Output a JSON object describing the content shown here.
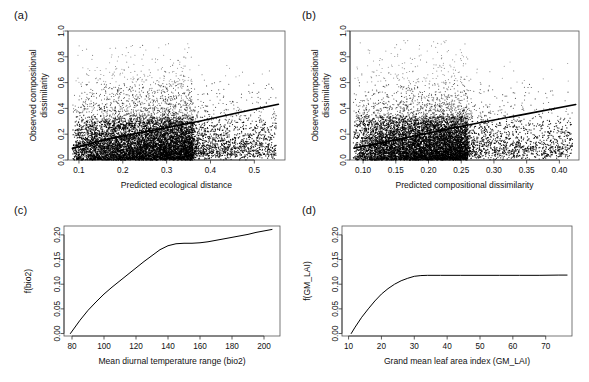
{
  "figure": {
    "background": "#ffffff",
    "ink": "#111111",
    "panel_tags": [
      "(a)",
      "(b)",
      "(c)",
      "(d)"
    ]
  },
  "chart_data": [
    {
      "type": "scatter",
      "panel": "(a)",
      "title": "",
      "xlabel": "Predicted ecological distance",
      "ylabel": "Observed compositional dissimilarity",
      "ylabel_lines": [
        "Observed compositional",
        "dissimilarity"
      ],
      "xlim": [
        0.075,
        0.57
      ],
      "ylim": [
        0.0,
        1.0
      ],
      "xticks": [
        0.1,
        0.2,
        0.3,
        0.4,
        0.5
      ],
      "xtick_labels": [
        "0.1",
        "0.2",
        "0.3",
        "0.4",
        "0.5"
      ],
      "yticks": [
        0.0,
        0.2,
        0.4,
        0.6,
        0.8,
        1.0
      ],
      "ytick_labels": [
        "0.0",
        "0.2",
        "0.4",
        "0.6",
        "0.8",
        "1.0"
      ],
      "grid": false,
      "legend": "none",
      "point_color": "#000000",
      "point_count": 9000,
      "cloud": {
        "x_core": [
          0.085,
          0.36
        ],
        "x_tail": [
          0.36,
          0.55
        ],
        "y_dense_max": 0.33,
        "y_sparse_max": 1.0,
        "description": "dense black cloud concentrated below y=0.35, thinning upward to y=1.0, trailing sparse points to the right"
      },
      "fit_line": {
        "name": "trend line",
        "x": [
          0.085,
          0.15,
          0.22,
          0.3,
          0.38,
          0.46,
          0.555
        ],
        "y": [
          0.09,
          0.15,
          0.2,
          0.25,
          0.305,
          0.365,
          0.432
        ],
        "color": "#000000",
        "width": 1.6
      }
    },
    {
      "type": "scatter",
      "panel": "(b)",
      "title": "",
      "xlabel": "Predicted compositional dissimilarity",
      "ylabel": "Observed compositional dissimilarity",
      "ylabel_lines": [
        "Observed compositional",
        "dissimilarity"
      ],
      "xlim": [
        0.08,
        0.43
      ],
      "ylim": [
        0.0,
        1.0
      ],
      "xticks": [
        0.1,
        0.15,
        0.2,
        0.25,
        0.3,
        0.35,
        0.4
      ],
      "xtick_labels": [
        "0.10",
        "0.15",
        "0.20",
        "0.25",
        "0.30",
        "0.35",
        "0.40"
      ],
      "yticks": [
        0.0,
        0.2,
        0.4,
        0.6,
        0.8,
        1.0
      ],
      "ytick_labels": [
        "0.0",
        "0.2",
        "0.4",
        "0.6",
        "0.8",
        "1.0"
      ],
      "grid": false,
      "legend": "none",
      "point_color": "#000000",
      "point_count": 9000,
      "cloud": {
        "x_core": [
          0.085,
          0.26
        ],
        "x_tail": [
          0.26,
          0.42
        ],
        "y_dense_max": 0.34,
        "y_sparse_max": 1.0,
        "description": "dense black cloud to x=0.26 with sharp right edge, scattered plume to x=0.42"
      },
      "fit_line": {
        "name": "trend line",
        "x": [
          0.086,
          0.13,
          0.18,
          0.23,
          0.28,
          0.34,
          0.425
        ],
        "y": [
          0.092,
          0.135,
          0.188,
          0.24,
          0.29,
          0.348,
          0.43
        ],
        "color": "#000000",
        "width": 1.6
      }
    },
    {
      "type": "line",
      "panel": "(c)",
      "title": "",
      "xlabel": "Mean diurnal temperature range (bio2)",
      "ylabel": "f(bio2)",
      "xlim": [
        75,
        210
      ],
      "ylim": [
        -0.005,
        0.218
      ],
      "xticks": [
        80,
        100,
        120,
        140,
        160,
        180,
        200
      ],
      "xtick_labels": [
        "80",
        "100",
        "120",
        "140",
        "160",
        "180",
        "200"
      ],
      "yticks": [
        0.0,
        0.05,
        0.1,
        0.15,
        0.2
      ],
      "ytick_labels": [
        "0.00",
        "0.05",
        "0.10",
        "0.15",
        "0.20"
      ],
      "grid": false,
      "legend": "none",
      "line_color": "#000000",
      "x": [
        79,
        85,
        90,
        95,
        100,
        105,
        110,
        115,
        120,
        125,
        130,
        135,
        140,
        145,
        150,
        155,
        160,
        165,
        170,
        175,
        180,
        185,
        190,
        195,
        200,
        205
      ],
      "y": [
        0.0,
        0.027,
        0.047,
        0.064,
        0.08,
        0.094,
        0.107,
        0.12,
        0.133,
        0.146,
        0.158,
        0.17,
        0.178,
        0.182,
        0.183,
        0.183,
        0.184,
        0.186,
        0.189,
        0.192,
        0.195,
        0.198,
        0.201,
        0.205,
        0.208,
        0.211
      ]
    },
    {
      "type": "line",
      "panel": "(d)",
      "title": "",
      "xlabel": "Grand mean leaf area index (GM_LAI)",
      "ylabel": "f(GM_LAI)",
      "xlim": [
        8,
        78
      ],
      "ylim": [
        -0.005,
        0.218
      ],
      "xticks": [
        10,
        20,
        30,
        40,
        50,
        60,
        70
      ],
      "xtick_labels": [
        "10",
        "20",
        "30",
        "40",
        "50",
        "60",
        "70"
      ],
      "yticks": [
        0.0,
        0.05,
        0.1,
        0.15,
        0.2
      ],
      "ytick_labels": [
        "0.00",
        "0.05",
        "0.10",
        "0.15",
        "0.20"
      ],
      "grid": false,
      "legend": "none",
      "line_color": "#000000",
      "x": [
        10.8,
        12,
        14,
        16,
        18,
        20,
        22,
        24,
        26,
        28,
        30,
        32,
        34,
        38,
        44,
        50,
        56,
        62,
        68,
        74,
        76.5
      ],
      "y": [
        0.0,
        0.013,
        0.033,
        0.05,
        0.066,
        0.08,
        0.091,
        0.1,
        0.107,
        0.112,
        0.116,
        0.1175,
        0.118,
        0.118,
        0.118,
        0.118,
        0.118,
        0.118,
        0.118,
        0.1185,
        0.1185
      ]
    }
  ]
}
